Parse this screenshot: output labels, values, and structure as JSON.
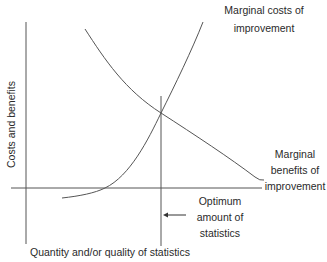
{
  "diagram": {
    "y_axis_label": "Costs and benefits",
    "x_axis_label": "Quantity and/or quality of statistics",
    "curves": [
      {
        "name": "Marginal costs of improvement",
        "line1": "Marginal costs of",
        "line2": "improvement",
        "shape": "increasing convex"
      },
      {
        "name": "Marginal benefits of improvement",
        "line1": "Marginal",
        "line2": "benefits of",
        "line3": "improvement",
        "shape": "decreasing"
      }
    ],
    "optimum": {
      "line1": "Optimum",
      "line2": "amount of",
      "line3": "statistics",
      "arrow": "left-arrow"
    }
  },
  "colors": {
    "line": "#555555",
    "text": "#2a2a2a",
    "background": "#ffffff"
  }
}
